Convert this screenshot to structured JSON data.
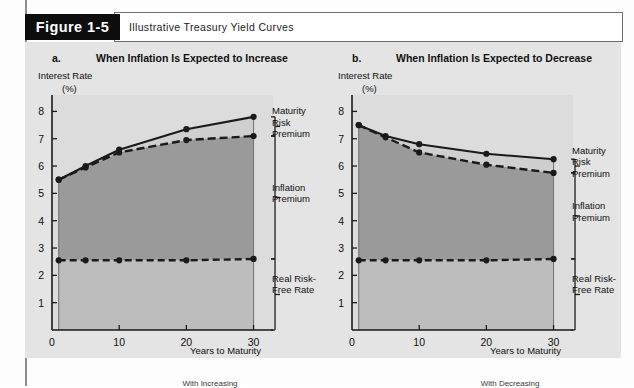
{
  "figure": {
    "tag": "Figure 1-5",
    "title": "Illustrative Treasury Yield Curves"
  },
  "colors": {
    "panel_bg": "#e4e4e4",
    "plot_bg": "#dcdcdc",
    "inflation_fill": "#9a9a9a",
    "real_fill": "#bdbdbd",
    "mrp_fill": "#cfcfcf",
    "line": "#1a1a1a",
    "tag_bg": "#0d0d0d"
  },
  "panels": [
    {
      "letter": "a.",
      "heading": "When Inflation Is Expected to Increase",
      "y_axis_title_line1": "Interest Rate",
      "y_axis_title_line2": "(%)",
      "x_axis_title": "Years to Maturity",
      "annotations": {
        "maturity_risk_premium": [
          "Maturity",
          "Risk",
          "Premium"
        ],
        "inflation_premium": [
          "Inflation",
          "Premium"
        ],
        "real_risk_free_rate": [
          "Real Risk-",
          "Free Rate"
        ]
      },
      "footnote": "With Increasing"
    },
    {
      "letter": "b.",
      "heading": "When Inflation Is Expected to Decrease",
      "y_axis_title_line1": "Interest Rate",
      "y_axis_title_line2": "(%)",
      "x_axis_title": "Years to Maturity",
      "annotations": {
        "maturity_risk_premium": [
          "Maturity",
          "Risk",
          "Premium"
        ],
        "inflation_premium": [
          "Inflation",
          "Premium"
        ],
        "real_risk_free_rate": [
          "Real Risk-",
          "Free Rate"
        ]
      },
      "footnote": "With Decreasing"
    }
  ],
  "chart_data": [
    {
      "type": "line",
      "title": "When Inflation Is Expected to Increase",
      "xlabel": "Years to Maturity",
      "ylabel": "Interest Rate (%)",
      "xlim": [
        0,
        32
      ],
      "ylim": [
        0,
        8.6
      ],
      "xticks": [
        0,
        10,
        20,
        30
      ],
      "xticklabels": [
        "0",
        "10",
        "20",
        "30"
      ],
      "yticks": [
        1,
        2,
        3,
        4,
        5,
        6,
        7,
        8
      ],
      "yticklabels": [
        "1",
        "2",
        "3",
        "4",
        "5",
        "6",
        "7",
        "8"
      ],
      "grid": false,
      "legend": "annotations-right",
      "x": [
        1,
        5,
        10,
        20,
        30
      ],
      "series": [
        {
          "name": "Nominal yield (with maturity risk premium)",
          "style": "solid",
          "marker": "circle",
          "values": [
            5.5,
            6.0,
            6.6,
            7.35,
            7.8
          ]
        },
        {
          "name": "Real risk-free rate + inflation premium",
          "style": "dashed",
          "marker": "circle",
          "values": [
            5.5,
            5.95,
            6.5,
            6.95,
            7.1
          ]
        },
        {
          "name": "Real risk-free rate",
          "style": "dashed",
          "marker": "circle",
          "values": [
            2.55,
            2.55,
            2.55,
            2.55,
            2.6
          ]
        }
      ],
      "annotations": [
        "Maturity Risk Premium",
        "Inflation Premium",
        "Real Risk-Free Rate"
      ]
    },
    {
      "type": "line",
      "title": "When Inflation Is Expected to Decrease",
      "xlabel": "Years to Maturity",
      "ylabel": "Interest Rate (%)",
      "xlim": [
        0,
        32
      ],
      "ylim": [
        0,
        8.6
      ],
      "xticks": [
        0,
        10,
        20,
        30
      ],
      "xticklabels": [
        "0",
        "10",
        "20",
        "30"
      ],
      "yticks": [
        1,
        2,
        3,
        4,
        5,
        6,
        7,
        8
      ],
      "yticklabels": [
        "1",
        "2",
        "3",
        "4",
        "5",
        "6",
        "7",
        "8"
      ],
      "grid": false,
      "legend": "annotations-right",
      "x": [
        1,
        5,
        10,
        20,
        30
      ],
      "series": [
        {
          "name": "Nominal yield (with maturity risk premium)",
          "style": "solid",
          "marker": "circle",
          "values": [
            7.5,
            7.1,
            6.8,
            6.45,
            6.25
          ]
        },
        {
          "name": "Real risk-free rate + inflation premium",
          "style": "dashed",
          "marker": "circle",
          "values": [
            7.5,
            7.05,
            6.5,
            6.05,
            5.75
          ]
        },
        {
          "name": "Real risk-free rate",
          "style": "dashed",
          "marker": "circle",
          "values": [
            2.55,
            2.55,
            2.55,
            2.55,
            2.6
          ]
        }
      ],
      "annotations": [
        "Maturity Risk Premium",
        "Inflation Premium",
        "Real Risk-Free Rate"
      ]
    }
  ]
}
